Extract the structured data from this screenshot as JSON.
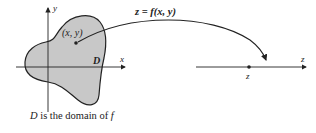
{
  "diagram": {
    "domain_label": "D",
    "point_label": "(x, y)",
    "function_label": "z = f(x, y)",
    "x_axis_label": "x",
    "y_axis_label": "y",
    "z_axis_label": "z",
    "z_point_label": "z",
    "caption": {
      "var": "D",
      "text": " is the domain of ",
      "func": "f"
    },
    "colors": {
      "region_fill": "#c8c8c8",
      "stroke": "#222222"
    }
  }
}
